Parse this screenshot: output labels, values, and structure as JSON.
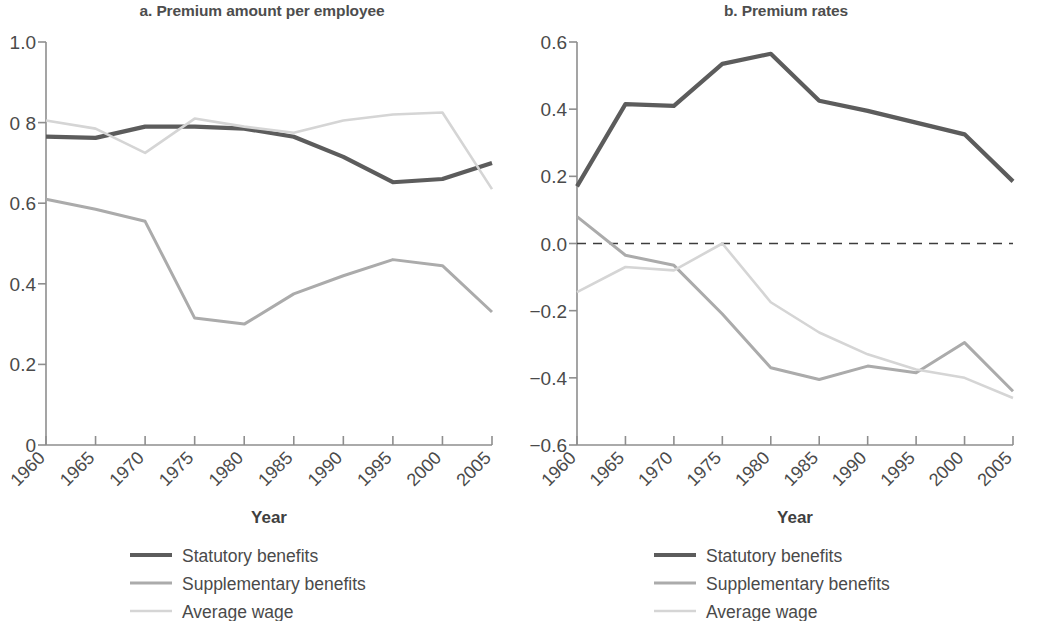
{
  "figure": {
    "axis_title": "Year",
    "legend": [
      {
        "label": "Statutory benefits",
        "color": "#5c5c5c",
        "width": 4.2
      },
      {
        "label": "Supplementary benefits",
        "color": "#ababab",
        "width": 3.0
      },
      {
        "label": "Average wage",
        "color": "#d5d5d5",
        "width": 2.6
      }
    ]
  },
  "chart_data": [
    {
      "type": "line",
      "panel": "a",
      "title": "a. Premium amount per employee",
      "xlabel": "Year",
      "ylabel": "",
      "x": [
        1960,
        1965,
        1970,
        1975,
        1980,
        1985,
        1990,
        1995,
        2000,
        2005
      ],
      "categories": [
        "1960",
        "1965",
        "1970",
        "1975",
        "1980",
        "1985",
        "1990",
        "1995",
        "2000",
        "2005"
      ],
      "ylim": [
        0,
        1.0
      ],
      "yticks": [
        0,
        0.2,
        0.4,
        0.6,
        0.8,
        1.0
      ],
      "ytick_labels": [
        "0",
        "0.2",
        "0.4",
        "0.6",
        "0 8",
        "1.0"
      ],
      "grid": false,
      "legend_position": "below",
      "series": [
        {
          "name": "Statutory benefits",
          "color": "#5c5c5c",
          "values": [
            0.765,
            0.762,
            0.79,
            0.79,
            0.785,
            0.765,
            0.715,
            0.652,
            0.66,
            0.7
          ]
        },
        {
          "name": "Supplementary benefits",
          "color": "#ababab",
          "values": [
            0.61,
            0.585,
            0.555,
            0.315,
            0.3,
            0.375,
            0.42,
            0.46,
            0.445,
            0.33
          ]
        },
        {
          "name": "Average wage",
          "color": "#d5d5d5",
          "values": [
            0.805,
            0.785,
            0.725,
            0.81,
            0.79,
            0.775,
            0.805,
            0.82,
            0.825,
            0.635
          ]
        }
      ]
    },
    {
      "type": "line",
      "panel": "b",
      "title": "b. Premium rates",
      "xlabel": "Year",
      "ylabel": "",
      "x": [
        1960,
        1965,
        1970,
        1975,
        1980,
        1985,
        1990,
        1995,
        2000,
        2005
      ],
      "categories": [
        "1960",
        "1965",
        "1970",
        "1975",
        "1980",
        "1985",
        "1990",
        "1995",
        "2000",
        "2005"
      ],
      "ylim": [
        -0.6,
        0.6
      ],
      "yticks": [
        -0.6,
        -0.4,
        -0.2,
        0.0,
        0.2,
        0.4,
        0.6
      ],
      "ytick_labels": [
        "−0.6",
        "−0.4",
        "−0.2",
        "0.0",
        "0.2",
        "0.4",
        "0.6"
      ],
      "grid": false,
      "zero_line": true,
      "legend_position": "below",
      "series": [
        {
          "name": "Statutory benefits",
          "color": "#5c5c5c",
          "values": [
            0.17,
            0.415,
            0.41,
            0.535,
            0.565,
            0.425,
            0.395,
            0.36,
            0.325,
            0.185
          ]
        },
        {
          "name": "Supplementary benefits",
          "color": "#ababab",
          "values": [
            0.08,
            -0.035,
            -0.065,
            -0.21,
            -0.37,
            -0.405,
            -0.365,
            -0.385,
            -0.295,
            -0.44
          ]
        },
        {
          "name": "Average wage",
          "color": "#d5d5d5",
          "values": [
            -0.145,
            -0.07,
            -0.08,
            0.0,
            -0.175,
            -0.265,
            -0.33,
            -0.375,
            -0.4,
            -0.46
          ]
        }
      ]
    }
  ]
}
